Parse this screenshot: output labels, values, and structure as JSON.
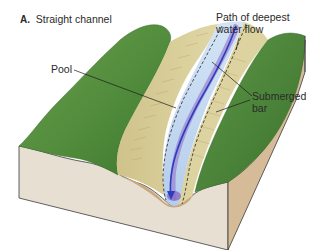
{
  "figure": {
    "panel_letter": "A.",
    "title": "Straight channel"
  },
  "labels": {
    "pool": "Pool",
    "path_line1": "Path of deepest",
    "path_line2": "water flow",
    "bar_line1": "Submerged",
    "bar_line2": "bar"
  },
  "colors": {
    "grass": "#4f8a3a",
    "grass_dark": "#3d7230",
    "grass_light": "#6aa04e",
    "bank_sand": "#d8cf9a",
    "bank_sand_dark": "#c2b57a",
    "water_light": "#b9d3ef",
    "water_deep": "#8a6cc4",
    "flow_line": "#2a3ec0",
    "soil_front": "#e6ddd0",
    "soil_side": "#d4b896",
    "outline": "#3a3a3a"
  }
}
